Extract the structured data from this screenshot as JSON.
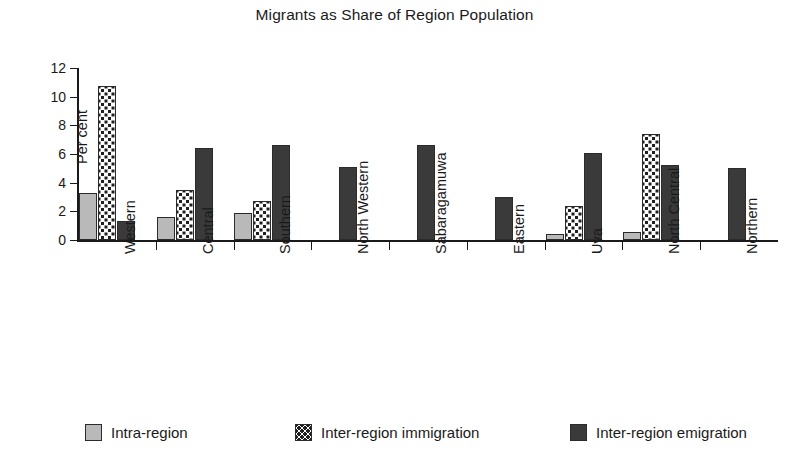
{
  "chart_data": {
    "type": "bar",
    "title": "Migrants as Share of Region Population",
    "xlabel": "",
    "ylabel": "Per cent",
    "ylim": [
      0,
      12
    ],
    "yticks": [
      0,
      2,
      4,
      6,
      8,
      10,
      12
    ],
    "ytick_labels": [
      "0",
      "2",
      "4",
      "6",
      "8",
      "10",
      "12"
    ],
    "grid": false,
    "legend_position": "bottom",
    "categories": [
      "Western",
      "Central",
      "Southern",
      "North Western",
      "Sabaragamuwa",
      "Eastern",
      "Uva",
      "North Central",
      "Northern"
    ],
    "series": [
      {
        "name": "Intra-region",
        "color": "#b9b9b9",
        "pattern": "solid-light-gray",
        "values": [
          3.3,
          1.6,
          1.9,
          0,
          0,
          0,
          0.45,
          0.55,
          0
        ]
      },
      {
        "name": "Inter-region immigration",
        "color": "#fdfdfd",
        "pattern": "dotted",
        "values": [
          10.75,
          3.5,
          2.7,
          0,
          0,
          0,
          2.4,
          7.4,
          0
        ]
      },
      {
        "name": "Inter-region emigration",
        "color": "#3a3a3a",
        "pattern": "solid-dark-gray",
        "values": [
          1.35,
          6.4,
          6.6,
          5.1,
          6.6,
          3.0,
          6.1,
          5.25,
          5.0
        ]
      }
    ]
  },
  "legend": {
    "items": [
      {
        "label": "Intra-region"
      },
      {
        "label": "Inter-region immigration"
      },
      {
        "label": "Inter-region emigration"
      }
    ]
  }
}
